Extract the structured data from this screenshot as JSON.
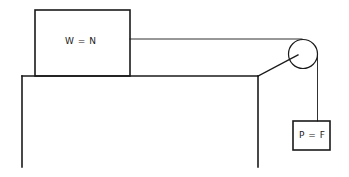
{
  "diagram": {
    "type": "pulley-system",
    "block_on_table": {
      "label": "W = N"
    },
    "hanging_block": {
      "label": "P = F"
    },
    "colors": {
      "line": "#1a1a1a",
      "background": "#ffffff"
    }
  }
}
